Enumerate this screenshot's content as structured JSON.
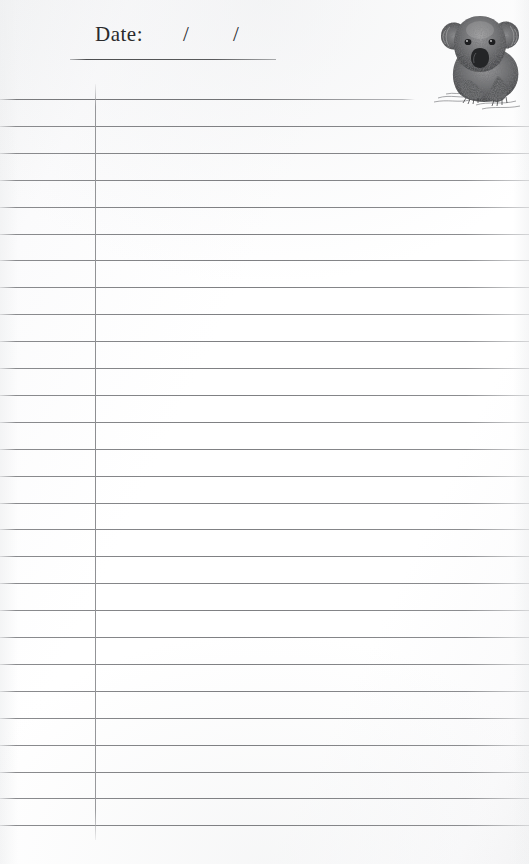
{
  "page": {
    "kind": "lined-notepad-page",
    "width": 529,
    "height": 864,
    "background_color": "#ffffff",
    "rule_color": "#7e7f82",
    "margin_line_color": "#8c8d90",
    "ink_color": "#2a2a2c"
  },
  "header": {
    "date_label": "Date:",
    "slash_1": "/",
    "slash_2": "/",
    "underline_present": true
  },
  "illustration": {
    "name": "koala-illustration",
    "subject": "koala",
    "style": "stipple pen-and-ink drawing",
    "description": "Seated koala facing forward with fluffy ears, dark oval nose and front paws resting on a sketched ground line",
    "color": "#3a3a3c"
  },
  "rules": {
    "count": 28,
    "first_y": 99,
    "spacing": 26.9,
    "first_rule_is_short": true,
    "first_rule_right_edge": 415,
    "full_width_right_edge": 529
  },
  "margin": {
    "x": 95,
    "top": 84,
    "bottom": 840
  }
}
